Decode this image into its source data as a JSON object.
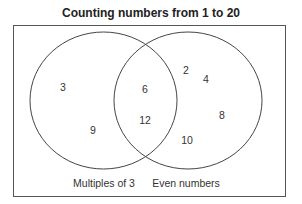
{
  "title": "Counting numbers from 1 to 20",
  "universe_box": {
    "x": 13,
    "y": 25,
    "width": 272,
    "height": 171,
    "stroke": "#555555"
  },
  "sets": [
    {
      "label": "Multiples of 3",
      "cx": 103.5,
      "cy": 100.5,
      "rx": 73.5,
      "ry": 68.5,
      "label_x": 104,
      "label_y": 187
    },
    {
      "label": "Even numbers",
      "cx": 188,
      "cy": 100.5,
      "rx": 74,
      "ry": 68.5,
      "label_x": 186,
      "label_y": 187
    }
  ],
  "regions": {
    "multiples_of_3_only": [
      {
        "value": "3",
        "x": 63,
        "y": 91
      },
      {
        "value": "9",
        "x": 93,
        "y": 134
      }
    ],
    "both": [
      {
        "value": "6",
        "x": 145,
        "y": 93
      },
      {
        "value": "12",
        "x": 145,
        "y": 124
      }
    ],
    "even_only": [
      {
        "value": "2",
        "x": 186,
        "y": 74
      },
      {
        "value": "4",
        "x": 206,
        "y": 83
      },
      {
        "value": "8",
        "x": 222,
        "y": 119
      },
      {
        "value": "10",
        "x": 187,
        "y": 144
      }
    ]
  }
}
